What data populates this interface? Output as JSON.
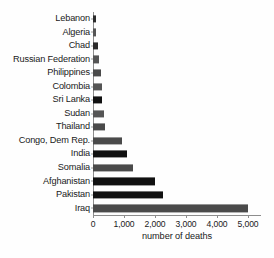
{
  "chart_data": {
    "type": "bar",
    "orientation": "horizontal",
    "title": "",
    "xlabel": "number of deaths",
    "ylabel": "",
    "categories": [
      "Lebanon",
      "Algeria",
      "Chad",
      "Russian Federation",
      "Philippines",
      "Colombia",
      "Sri Lanka",
      "Sudan",
      "Thailand",
      "Congo, Dem Rep.",
      "India",
      "Somalia",
      "Afghanistan",
      "Pakistan",
      "Iraq"
    ],
    "values": [
      100,
      110,
      160,
      190,
      250,
      280,
      300,
      340,
      390,
      950,
      1100,
      1300,
      2000,
      2250,
      5000
    ],
    "colors": [
      "#2b2b2b",
      "#555555",
      "#2b2b2b",
      "#555555",
      "#4a4a4a",
      "#555555",
      "#111111",
      "#555555",
      "#4a4a4a",
      "#4a4a4a",
      "#111111",
      "#4a4a4a",
      "#111111",
      "#111111",
      "#4a4a4a"
    ],
    "xlim": [
      0,
      5500
    ],
    "xticks": [
      0,
      1000,
      2000,
      3000,
      4000,
      5000
    ],
    "xtick_labels": [
      "0",
      "1,000",
      "2,000",
      "3,000",
      "4,000",
      "5,000"
    ],
    "grid": false,
    "legend": false,
    "axis_color": "#8d8d8d",
    "background": "#fefefe"
  }
}
